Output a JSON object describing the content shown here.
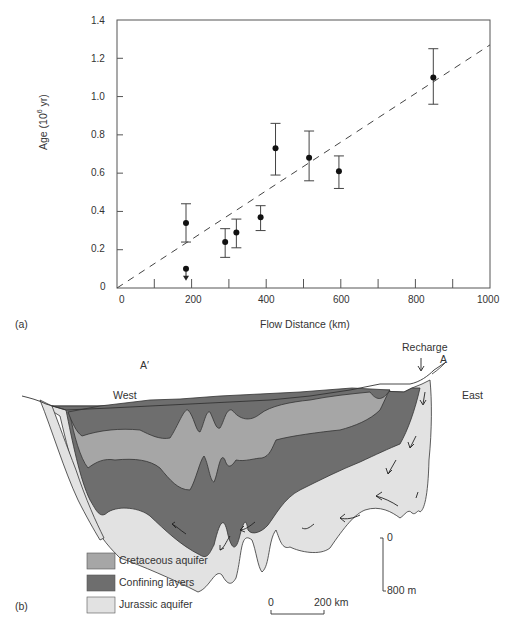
{
  "panel_a": {
    "label": "(a)",
    "x_axis_title": "Flow Distance (km)",
    "y_axis_title_prefix": "Age (10",
    "y_axis_title_sup": "6",
    "y_axis_title_suffix": " yr)",
    "x_tick_labels": [
      "0",
      "200",
      "400",
      "600",
      "800",
      "1000"
    ],
    "y_tick_labels": [
      "0",
      "0.2",
      "0.4",
      "0.6",
      "0.8",
      "1.0",
      "1.2",
      "1.4"
    ]
  },
  "panel_b": {
    "label": "(b)",
    "labels": {
      "recharge": "Recharge",
      "a": "A",
      "a_prime": "A′",
      "west": "West",
      "east": "East"
    },
    "legend": [
      {
        "label": "Cretaceous aquifer",
        "color": "#a6a6a6"
      },
      {
        "label": "Confining layers",
        "color": "#6e6e6e"
      },
      {
        "label": "Jurassic aquifer",
        "color": "#e2e2e2"
      }
    ],
    "vertical_scale": {
      "top": "0",
      "bottom": "800 m"
    },
    "horizontal_scale": {
      "left": "0",
      "right": "200 km"
    }
  },
  "chart_data": {
    "type": "scatter",
    "title": "",
    "xlabel": "Flow Distance (km)",
    "ylabel": "Age (10^6 yr)",
    "xlim": [
      0,
      1000
    ],
    "ylim": [
      0,
      1.4
    ],
    "x_ticks": [
      0,
      200,
      400,
      600,
      800,
      1000
    ],
    "x_minor_ticks": [
      100,
      300,
      500,
      700,
      900
    ],
    "y_ticks": [
      0,
      0.2,
      0.4,
      0.6,
      0.8,
      1.0,
      1.2,
      1.4
    ],
    "grid": false,
    "series": [
      {
        "name": "Groundwater age",
        "points": [
          {
            "x": 185,
            "y": 0.34,
            "err_low": 0.24,
            "err_high": 0.44
          },
          {
            "x": 185,
            "y": 0.1,
            "upper_limit": true
          },
          {
            "x": 290,
            "y": 0.24,
            "err_low": 0.16,
            "err_high": 0.31
          },
          {
            "x": 320,
            "y": 0.29,
            "err_low": 0.21,
            "err_high": 0.36
          },
          {
            "x": 385,
            "y": 0.37,
            "err_low": 0.3,
            "err_high": 0.43
          },
          {
            "x": 425,
            "y": 0.73,
            "err_low": 0.59,
            "err_high": 0.86
          },
          {
            "x": 515,
            "y": 0.68,
            "err_low": 0.56,
            "err_high": 0.82
          },
          {
            "x": 595,
            "y": 0.61,
            "err_low": 0.52,
            "err_high": 0.69
          },
          {
            "x": 848,
            "y": 1.1,
            "err_low": 0.96,
            "err_high": 1.25
          }
        ]
      },
      {
        "name": "Trend line (dashed)",
        "type": "line",
        "x": [
          0,
          1000
        ],
        "y": [
          0,
          1.27
        ]
      }
    ]
  }
}
